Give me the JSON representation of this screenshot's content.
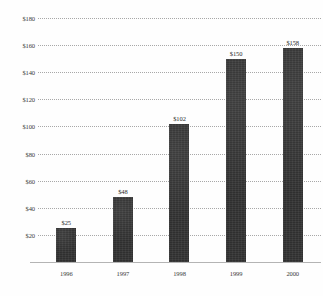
{
  "figure": {
    "title_artifact": "",
    "background_color": "#fefefe",
    "bar_color": "#2f2f2f",
    "gridline_color": "#a8a8a8",
    "axis_color": "#b4b4b4"
  },
  "chart_data": {
    "type": "bar",
    "title": "",
    "xlabel": "",
    "ylabel": "",
    "categories": [
      "1996",
      "1997",
      "1998",
      "1999",
      "2000"
    ],
    "values": [
      25,
      48,
      102,
      150,
      158
    ],
    "value_labels": [
      "$25",
      "$48",
      "$102",
      "$150",
      "$158"
    ],
    "ylim": [
      0,
      180
    ],
    "ytick_values": [
      20,
      40,
      60,
      80,
      100,
      120,
      140,
      160,
      180
    ],
    "ytick_labels": [
      "$20",
      "$40",
      "$60",
      "$80",
      "$100",
      "$120",
      "$140",
      "$160",
      "$180"
    ],
    "grid": true,
    "grid_style": "dotted",
    "legend": null,
    "legend_position": "none"
  }
}
